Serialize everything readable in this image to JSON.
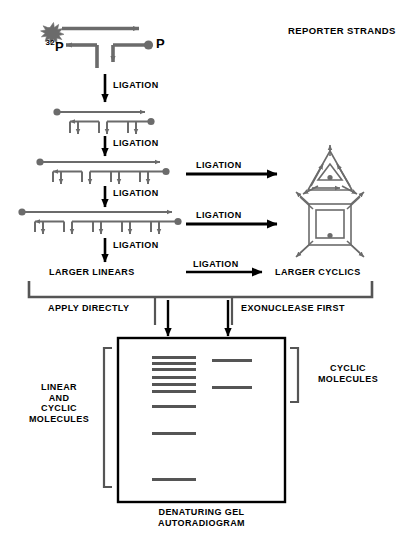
{
  "figure": {
    "title": "REPORTER STRANDS",
    "caption_line1": "DENATURING GEL",
    "caption_line2": "AUTORADIOGRAM",
    "colors": {
      "strand": "#6b6b6b",
      "ink": "#000000",
      "band": "#555555",
      "background": "#ffffff"
    }
  },
  "labels": {
    "radiolabel_sup": "32",
    "radiolabel_base": "P",
    "phosphate": "P",
    "ligation": "LIGATION",
    "larger_linears": "LARGER LINEARS",
    "larger_cyclics": "LARGER CYCLICS",
    "apply_directly": "APPLY DIRECTLY",
    "exonuclease_first": "EXONUCLEASE FIRST",
    "linear_and_cyclic": "LINEAR\nAND\nCYCLIC\nMOLECULES",
    "cyclic_molecules": "CYCLIC\nMOLECULES"
  },
  "ligation_steps": [
    {
      "label": "LIGATION",
      "from_units": 1,
      "to_units": 2
    },
    {
      "label": "LIGATION",
      "from_units": 2,
      "to_units": 3
    },
    {
      "label": "LIGATION",
      "from_units": 3,
      "to_units": 4
    },
    {
      "label": "LIGATION",
      "from_units": 4,
      "to_units": 5
    }
  ],
  "linear_species": [
    {
      "units": 1,
      "has_radiolabel": true,
      "has_phosphate": true
    },
    {
      "units": 2,
      "has_radiolabel": true,
      "has_phosphate": true
    },
    {
      "units": 3,
      "has_radiolabel": true,
      "has_phosphate": true
    },
    {
      "units": 4,
      "has_radiolabel": true,
      "has_phosphate": true
    }
  ],
  "cyclic_species": [
    {
      "shape": "triangle",
      "units": 3,
      "arrow_label": "LIGATION"
    },
    {
      "shape": "square",
      "units": 4,
      "arrow_label": "LIGATION"
    }
  ],
  "cyclization_arrow": {
    "label": "LIGATION"
  },
  "gel": {
    "lanes": [
      {
        "name": "lane-linear-and-cyclic",
        "source": "APPLY DIRECTLY",
        "bands": [
          {
            "y": 356,
            "width": 44
          },
          {
            "y": 362,
            "width": 44
          },
          {
            "y": 368,
            "width": 44
          },
          {
            "y": 376,
            "width": 44
          },
          {
            "y": 383,
            "width": 44
          },
          {
            "y": 390,
            "width": 44
          },
          {
            "y": 405,
            "width": 44
          },
          {
            "y": 432,
            "width": 44
          },
          {
            "y": 478,
            "width": 44
          }
        ]
      },
      {
        "name": "lane-cyclic-only",
        "source": "EXONUCLEASE FIRST",
        "bands": [
          {
            "y": 359,
            "width": 40
          },
          {
            "y": 386,
            "width": 40
          }
        ]
      }
    ]
  }
}
